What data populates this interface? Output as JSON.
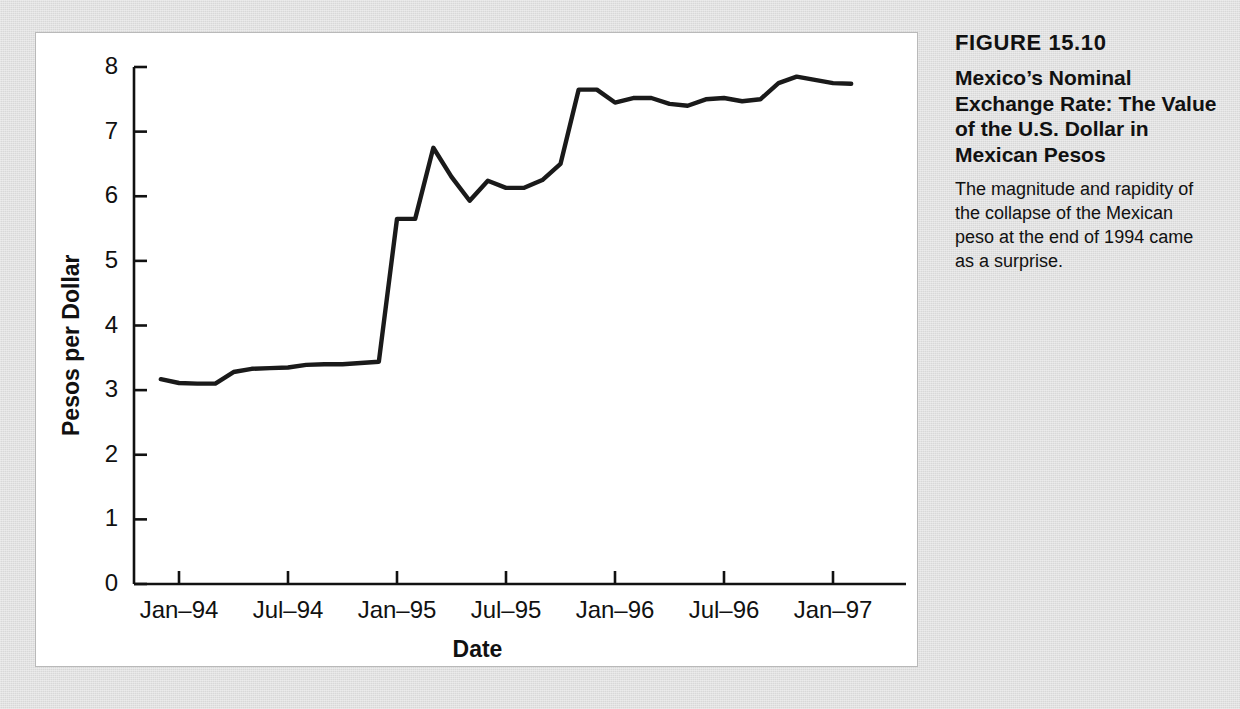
{
  "figure": {
    "number": "FIGURE 15.10",
    "title": "Mexico’s Nominal Exchange Rate: The Value of the U.S. Dollar in Mexican Pesos",
    "description": "The magnitude and rapidity of the collapse of the Mexican peso at the end of 1994 came as a surprise."
  },
  "chart_data": {
    "type": "line",
    "title": "Mexico’s Nominal Exchange Rate: The Value of the U.S. Dollar in Mexican Pesos",
    "xlabel": "Date",
    "ylabel": "Pesos per Dollar",
    "ylim": [
      0,
      8
    ],
    "yticks": [
      0,
      1,
      2,
      3,
      4,
      5,
      6,
      7,
      8
    ],
    "ytick_labels": [
      "0",
      "1",
      "2",
      "3",
      "4",
      "5",
      "6",
      "7",
      "8"
    ],
    "xtick_labels": [
      "Jan–94",
      "Jul–94",
      "Jan–95",
      "Jul–95",
      "Jan–96",
      "Jul–96",
      "Jan–97"
    ],
    "grid": false,
    "legend": false,
    "line_color": "#1a1a1a",
    "x": [
      "Dec-93",
      "Jan-94",
      "Feb-94",
      "Mar-94",
      "Apr-94",
      "May-94",
      "Jun-94",
      "Jul-94",
      "Aug-94",
      "Sep-94",
      "Oct-94",
      "Nov-94",
      "Dec-94",
      "Jan-95",
      "Feb-95",
      "Mar-95",
      "Apr-95",
      "May-95",
      "Jun-95",
      "Jul-95",
      "Aug-95",
      "Sep-95",
      "Oct-95",
      "Nov-95",
      "Dec-95",
      "Jan-96",
      "Feb-96",
      "Mar-96",
      "Apr-96",
      "May-96",
      "Jun-96",
      "Jul-96",
      "Aug-96",
      "Sep-96",
      "Oct-96",
      "Nov-96",
      "Dec-96",
      "Jan-97",
      "Feb-97"
    ],
    "values": [
      3.17,
      3.11,
      3.1,
      3.1,
      3.28,
      3.33,
      3.34,
      3.35,
      3.39,
      3.4,
      3.4,
      3.42,
      3.44,
      5.65,
      5.65,
      6.75,
      6.3,
      5.93,
      6.24,
      6.13,
      6.13,
      6.25,
      6.5,
      7.65,
      7.65,
      7.45,
      7.52,
      7.52,
      7.43,
      7.4,
      7.5,
      7.52,
      7.47,
      7.5,
      7.75,
      7.85,
      7.8,
      7.75,
      7.74
    ],
    "series": [
      {
        "name": "Pesos per Dollar",
        "values": [
          3.17,
          3.11,
          3.1,
          3.1,
          3.28,
          3.33,
          3.34,
          3.35,
          3.39,
          3.4,
          3.4,
          3.42,
          3.44,
          5.65,
          5.65,
          6.75,
          6.3,
          5.93,
          6.24,
          6.13,
          6.13,
          6.25,
          6.5,
          7.65,
          7.65,
          7.45,
          7.52,
          7.52,
          7.43,
          7.4,
          7.5,
          7.52,
          7.47,
          7.5,
          7.75,
          7.85,
          7.8,
          7.75,
          7.74
        ]
      }
    ]
  }
}
